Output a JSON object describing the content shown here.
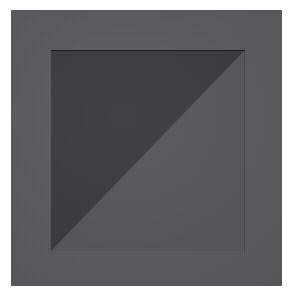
{
  "artwork": {
    "title": "Divided Square",
    "medium": "flat color geometric composition",
    "canvas": {
      "width": 290,
      "height": 296,
      "background_color": "#ffffff"
    },
    "panel": {
      "name": "gray ground panel",
      "color": "#58585b",
      "x": 11,
      "y": 10,
      "width": 271,
      "height": 276
    },
    "inner_square": {
      "name": "inner square",
      "x": 51,
      "y": 50,
      "width": 194,
      "height": 201,
      "edge_line_color": "#1a1a1c",
      "division": "diagonal from top-left corner to bottom-right corner",
      "regions": [
        {
          "name": "lower-left triangle",
          "color": "#3a3a3c",
          "tone": "dark",
          "vertices": "top-left, bottom-left, bottom-right"
        },
        {
          "name": "upper-right triangle",
          "color": "#555558",
          "tone": "light",
          "vertices": "top-left, top-right, bottom-right"
        }
      ]
    },
    "surface": {
      "texture": "fine woven canvas grain"
    }
  }
}
